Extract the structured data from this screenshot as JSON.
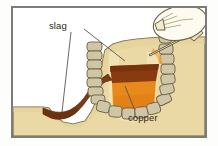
{
  "figure": {
    "frame_color": "#7b7b7b",
    "sky_color": "#ffffff"
  },
  "labels": {
    "slag": "slag",
    "copper": "copper"
  },
  "scene": {
    "ground": {
      "name": "ground-earth",
      "color": "#ead9a4",
      "outline": "#6d6140"
    },
    "furnace": {
      "name": "furnace-pit",
      "stone_fill": "#cfc6a8",
      "stone_outline": "#6d6140",
      "lining_fill": "#f0e4b4"
    },
    "molten_copper": {
      "name": "molten-copper-pool",
      "color": "#e8891c"
    },
    "slag_layer": {
      "name": "slag-layer",
      "color": "#8a3a10"
    },
    "slag_channel": {
      "name": "slag-runoff-channel",
      "color": "#7a3a12"
    },
    "bellows": {
      "name": "bellows-bag",
      "color": "#fdfaf0",
      "outline": "#6d6140"
    },
    "blowpipe": {
      "name": "blowpipe-tuyere",
      "color": "#efe7c8",
      "outline": "#4a4436"
    },
    "leader_line_color": "#5a5650"
  }
}
